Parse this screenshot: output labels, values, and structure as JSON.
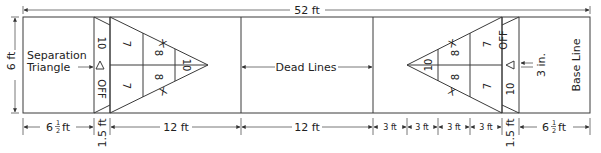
{
  "diagram": {
    "overall_length": "52 ft",
    "court_width": "6 ft",
    "labels": {
      "separation_triangle": [
        "Separation",
        "Triangle"
      ],
      "dead_lines": "Dead Lines",
      "base_line": "Base Line",
      "three_in": "3 in."
    },
    "left_scoring": {
      "strip_top": "10",
      "strip_bottom": "OFF",
      "row1": [
        "7",
        "8",
        "10"
      ],
      "row2": [
        "7",
        "8"
      ],
      "x_marks": [
        "X",
        "X"
      ]
    },
    "right_scoring": {
      "strip_top": "OFF",
      "strip_bottom": "10",
      "row1": [
        "10",
        "8",
        "7"
      ],
      "row2": [
        "8",
        "7"
      ],
      "x_marks": [
        "X",
        "X"
      ]
    },
    "bottom_dimensions": {
      "left_base": "6",
      "left_base_frac_num": "1",
      "left_base_frac_den": "2",
      "left_base_unit": "ft",
      "left_strip": "1.5 ft",
      "left_triangle": "12 ft",
      "middle": "12 ft",
      "right_segments": [
        "3 ft",
        "3 ft",
        "3 ft",
        "3 ft"
      ],
      "right_strip": "1.5 ft",
      "right_base": "6",
      "right_base_frac_num": "1",
      "right_base_frac_den": "2",
      "right_base_unit": "ft"
    }
  }
}
